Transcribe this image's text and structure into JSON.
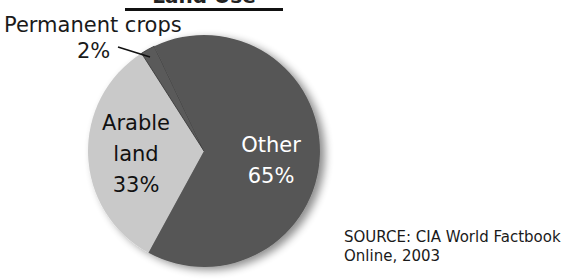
{
  "chart_data": {
    "type": "pie",
    "title": "Land Use",
    "categories": [
      "Arable land",
      "Permanent crops",
      "Other"
    ],
    "values": [
      33,
      2,
      65
    ],
    "unit": "%",
    "colors": [
      "#c9c9c9",
      "#5a5a5a",
      "#575757"
    ],
    "start_angle_deg": 208.6,
    "labels": [
      {
        "name": "Arable land",
        "value": "33%",
        "position": "inside"
      },
      {
        "name": "Permanent crops",
        "value": "2%",
        "position": "outside-leader-line"
      },
      {
        "name": "Other",
        "value": "65%",
        "position": "inside"
      }
    ],
    "source": "SOURCE: CIA World Factbook Online, 2003"
  },
  "title": "Land Use",
  "labels": {
    "permanent_name": "Permanent crops",
    "permanent_value": "2%",
    "arable_line1": "Arable",
    "arable_line2": "land",
    "arable_value": "33%",
    "other_name": "Other",
    "other_value": "65%"
  },
  "source": {
    "line1": "SOURCE: CIA World Factbook",
    "line2": "Online, 2003"
  },
  "geometry": {
    "cx": 204,
    "cy": 151,
    "r": 116
  }
}
